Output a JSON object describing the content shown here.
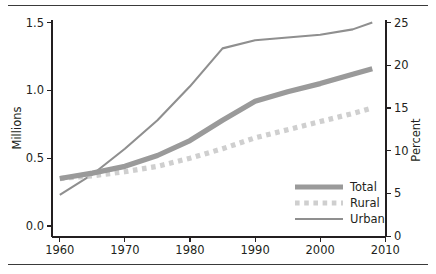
{
  "chart_data": {
    "type": "line",
    "title": "",
    "subtitle": "",
    "xlabel": "",
    "ylabel": "Millions",
    "y2label": "Percent",
    "grid": false,
    "legend_position": "bottom-right",
    "xlim": [
      1960,
      2010
    ],
    "ylim": [
      0.0,
      1.6
    ],
    "y2lim": [
      0.0,
      26.6
    ],
    "xticks": [
      1960,
      1970,
      1980,
      1990,
      2000,
      2010
    ],
    "xticklabels": [
      "1960",
      "1970",
      "1980",
      "1990",
      "2000",
      "2010"
    ],
    "yticks": [
      0.0,
      0.5,
      1.0,
      1.5
    ],
    "yticklabels": [
      "0.0",
      "0.5",
      "1.0",
      "1.5"
    ],
    "y2ticks": [
      0,
      5,
      10,
      15,
      20,
      25
    ],
    "y2ticklabels": [
      "0",
      "5",
      "10",
      "15",
      "20",
      "25"
    ],
    "x": [
      1960,
      1965,
      1970,
      1975,
      1980,
      1985,
      1990,
      1995,
      2000,
      2005,
      2008
    ],
    "series": [
      {
        "name": "Total",
        "style": "thick-solid",
        "color": "#9a9a9a",
        "values": [
          0.35,
          0.39,
          0.44,
          0.52,
          0.63,
          0.78,
          0.92,
          0.99,
          1.05,
          1.12,
          1.16
        ],
        "percent_values": [
          5.8,
          6.5,
          7.3,
          8.7,
          10.5,
          13.0,
          15.3,
          16.5,
          17.5,
          18.7,
          19.3
        ]
      },
      {
        "name": "Rural",
        "style": "dotted",
        "color": "#cfcfcf",
        "values": [
          0.35,
          0.37,
          0.4,
          0.44,
          0.5,
          0.57,
          0.65,
          0.71,
          0.77,
          0.83,
          0.87
        ],
        "percent_values": [
          5.8,
          6.2,
          6.7,
          7.3,
          8.3,
          9.5,
          10.8,
          11.8,
          12.8,
          13.8,
          14.4
        ]
      },
      {
        "name": "Urban",
        "style": "thin-solid",
        "color": "#8f8f8f",
        "values": [
          0.23,
          0.38,
          0.57,
          0.78,
          1.03,
          1.31,
          1.37,
          1.39,
          1.41,
          1.45,
          1.5
        ],
        "percent_values": [
          3.8,
          6.3,
          9.5,
          13.0,
          17.2,
          21.8,
          22.8,
          23.2,
          23.5,
          24.2,
          25.0
        ]
      }
    ],
    "legend": [
      "Total",
      "Rural",
      "Urban"
    ],
    "colors": {
      "total": "#9a9a9a",
      "rural": "#cfcfcf",
      "urban": "#8f8f8f",
      "axis": "#231f20",
      "rule": "#3a3a3a",
      "background": "#ffffff"
    }
  }
}
